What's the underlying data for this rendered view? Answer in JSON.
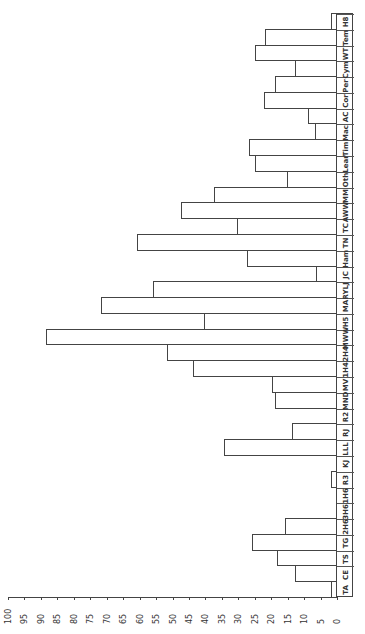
{
  "chart_data": {
    "type": "bar",
    "orientation": "rotated-90-ccw",
    "title": "",
    "xlabel": "",
    "ylabel": "",
    "ylim": [
      0,
      100
    ],
    "yticks": [
      0,
      5,
      10,
      15,
      20,
      25,
      30,
      35,
      40,
      45,
      50,
      55,
      60,
      65,
      70,
      75,
      80,
      85,
      90,
      95,
      100
    ],
    "categories": [
      "TA",
      "CE",
      "TS",
      "TG",
      "2H6",
      "3H6",
      "1H6",
      "R3",
      "KJ",
      "LLL",
      "RJ",
      "R2",
      "MND",
      "MV",
      "1H4",
      "2H4",
      "MWW",
      "H5",
      "MA",
      "RYLJ",
      "JC",
      "Ham",
      "TN",
      "TC",
      "AWW",
      "MM",
      "Oth",
      "Lear",
      "Tim",
      "Mac",
      "AC",
      "Cor",
      "Per",
      "Cym",
      "WT",
      "Tem",
      "H8"
    ],
    "values": [
      1.5,
      12.5,
      18,
      25.5,
      15.5,
      0,
      0,
      1.5,
      0,
      34,
      13.5,
      0,
      18.5,
      19.5,
      43.5,
      51.5,
      88,
      40,
      71.5,
      55.5,
      6,
      27,
      60.5,
      30,
      47,
      37,
      15,
      24.5,
      26.5,
      6.5,
      8.5,
      22,
      18.5,
      12.5,
      24.5,
      21.5,
      1.5
    ],
    "grid": false,
    "legend": null
  }
}
